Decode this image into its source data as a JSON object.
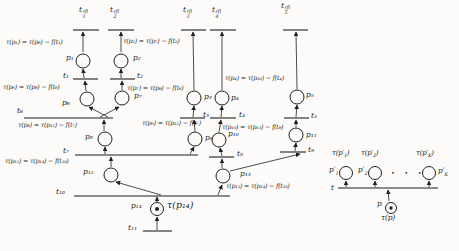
{
  "colors": {
    "ink": "#1f1f1f",
    "paper": "#fcfbf9"
  },
  "net": {
    "refill_transitions": [
      {
        "base": "t",
        "sup": "rfl",
        "sub": "1"
      },
      {
        "base": "t",
        "sup": "rfl",
        "sub": "2"
      },
      {
        "base": "t",
        "sup": "rfl",
        "sub": "3"
      },
      {
        "base": "t",
        "sup": "rfl",
        "sub": "4"
      },
      {
        "base": "t",
        "sup": "rfl",
        "sub": "5"
      }
    ],
    "place_labels": [
      "p₁",
      "p₂",
      "p₃",
      "p₄",
      "p₅",
      "p₆",
      "p₇",
      "p₈",
      "p₉",
      "p₁₀",
      "p₁₁",
      "p₁₂",
      "p₁₃",
      "p₁₄"
    ],
    "transition_labels": [
      "t₁",
      "t₂",
      "t₃",
      "t₄",
      "t₅",
      "t₆",
      "t₇",
      "t₈",
      "t₉",
      "t₁₀",
      "t₁₁"
    ],
    "formulas": [
      "τ(p₁) = τ(p₆) − f(t₁)",
      "τ(p₂) = τ(p₇) − f(t₂)",
      "τ(p₆) = τ(p₈) − f(t₆)",
      "τ(p₇) = τ(p₈) − f(t₆)",
      "τ(p₄) = τ(p₁₀) − f(t₄)",
      "τ(p₈) = τ(p₁₂) − f(t₇)",
      "τ(p₉) = τ(p₁₂) − f(t₇)",
      "τ(p₁₀) = τ(p₁₃) − f(t₈)",
      "τ(p₁₂) = τ(p₁₄) − f(t₁₀)",
      "τ(p₁₃) = τ(p₁₄) − f(t₁₀)",
      "τ(p₁₄)"
    ]
  },
  "legend": {
    "transition_label": "t",
    "input_place_label": "p",
    "input_token_formula": "τ(p)",
    "dots": "• • •",
    "outputs": [
      {
        "tau_pre": "τ(p′",
        "sub": "1",
        "tau_post": ")",
        "place_pre": "p′"
      },
      {
        "tau_pre": "τ(p′",
        "sub": "2",
        "tau_post": ")",
        "place_pre": "p′"
      },
      {
        "tau_pre": "τ(p′",
        "sub": "K",
        "tau_post": ")",
        "place_pre": "p′"
      }
    ]
  }
}
